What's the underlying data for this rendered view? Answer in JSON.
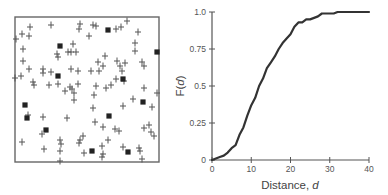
{
  "chart_data": [
    {
      "type": "scatter",
      "title": "",
      "description": "Spatial point pattern in a square plot: crosses and filled squares",
      "xlabel": "",
      "ylabel": "",
      "frame": {
        "left": 15,
        "top": 17,
        "right": 159,
        "bottom": 162
      },
      "series": [
        {
          "name": "cross",
          "marker": "+",
          "points": [
            [
              30,
              27
            ],
            [
              51,
              25
            ],
            [
              80,
              24
            ],
            [
              79,
              29
            ],
            [
              93,
              25
            ],
            [
              96,
              26
            ],
            [
              116,
              29
            ],
            [
              121,
              27
            ],
            [
              127,
              21
            ],
            [
              138,
              32
            ],
            [
              22,
              34
            ],
            [
              29,
              36
            ],
            [
              16,
              39
            ],
            [
              89,
              36
            ],
            [
              73,
              44
            ],
            [
              135,
              43
            ],
            [
              23,
              49
            ],
            [
              57,
              54
            ],
            [
              58,
              57
            ],
            [
              68,
              52
            ],
            [
              71,
              52
            ],
            [
              76,
              52
            ],
            [
              135,
              51
            ],
            [
              23,
              61
            ],
            [
              105,
              56
            ],
            [
              98,
              62
            ],
            [
              117,
              61
            ],
            [
              125,
              63
            ],
            [
              142,
              62
            ],
            [
              103,
              66
            ],
            [
              120,
              66
            ],
            [
              144,
              66
            ],
            [
              29,
              69
            ],
            [
              43,
              69
            ],
            [
              43,
              73
            ],
            [
              51,
              72
            ],
            [
              71,
              69
            ],
            [
              78,
              71
            ],
            [
              91,
              71
            ],
            [
              99,
              71
            ],
            [
              122,
              71
            ],
            [
              21,
              76
            ],
            [
              15,
              78
            ],
            [
              33,
              82
            ],
            [
              34,
              85
            ],
            [
              49,
              85
            ],
            [
              58,
              84
            ],
            [
              70,
              87
            ],
            [
              72,
              89
            ],
            [
              78,
              84
            ],
            [
              65,
              91
            ],
            [
              74,
              93
            ],
            [
              96,
              86
            ],
            [
              106,
              88
            ],
            [
              111,
              85
            ],
            [
              116,
              79
            ],
            [
              124,
              81
            ],
            [
              144,
              88
            ],
            [
              157,
              93
            ],
            [
              94,
              95
            ],
            [
              74,
              100
            ],
            [
              133,
              99
            ],
            [
              123,
              106
            ],
            [
              152,
              107
            ],
            [
              93,
              108
            ],
            [
              28,
              115
            ],
            [
              43,
              117
            ],
            [
              67,
              118
            ],
            [
              95,
              122
            ],
            [
              103,
              127
            ],
            [
              115,
              129
            ],
            [
              119,
              131
            ],
            [
              144,
              128
            ],
            [
              149,
              125
            ],
            [
              151,
              132
            ],
            [
              154,
              136
            ],
            [
              42,
              134
            ],
            [
              83,
              136
            ],
            [
              80,
              140
            ],
            [
              108,
              140
            ],
            [
              22,
              142
            ],
            [
              60,
              140
            ],
            [
              61,
              144
            ],
            [
              79,
              143
            ],
            [
              44,
              149
            ],
            [
              60,
              151
            ],
            [
              84,
              153
            ],
            [
              102,
              146
            ],
            [
              103,
              154
            ],
            [
              123,
              147
            ],
            [
              139,
              148
            ],
            [
              140,
              151
            ],
            [
              102,
              157
            ],
            [
              142,
              159
            ],
            [
              60,
              161
            ]
          ]
        },
        {
          "name": "square",
          "marker": "filled-square",
          "points": [
            [
              108,
              30
            ],
            [
              60,
              46
            ],
            [
              157,
              52
            ],
            [
              58,
              76
            ],
            [
              123,
              79
            ],
            [
              143,
              102
            ],
            [
              25,
              105
            ],
            [
              27,
              118
            ],
            [
              109,
              116
            ],
            [
              46,
              130
            ],
            [
              92,
              151
            ],
            [
              128,
              152
            ]
          ]
        }
      ]
    },
    {
      "type": "line",
      "title": "",
      "xlabel": "Distance, d",
      "xlabel_prefix": "Distance, ",
      "xlabel_var": "d",
      "ylabel": "F(d)",
      "xlim": [
        0,
        40
      ],
      "ylim": [
        0,
        1.0
      ],
      "grid": false,
      "legend": null,
      "x_ticks": [
        0,
        10,
        20,
        30,
        40
      ],
      "x_tick_labels": [
        "0",
        "10",
        "20",
        "30",
        "40"
      ],
      "y_ticks": [
        0,
        0.25,
        0.5,
        0.75,
        1.0
      ],
      "y_tick_labels": [
        "0",
        "0.25",
        "0.5",
        "0.75",
        "1.0"
      ],
      "series": [
        {
          "name": "F(d)",
          "x": [
            0,
            1,
            2,
            3,
            4,
            5,
            6,
            7,
            8,
            9,
            10,
            11,
            12,
            13,
            14,
            15,
            16,
            17,
            18,
            19,
            20,
            21,
            22,
            23,
            24,
            25,
            26,
            27,
            28,
            29,
            30,
            31,
            32,
            34,
            36,
            38,
            40
          ],
          "y": [
            0,
            0.01,
            0.02,
            0.03,
            0.05,
            0.08,
            0.1,
            0.17,
            0.22,
            0.3,
            0.37,
            0.42,
            0.5,
            0.55,
            0.62,
            0.66,
            0.7,
            0.75,
            0.79,
            0.82,
            0.85,
            0.9,
            0.93,
            0.93,
            0.95,
            0.95,
            0.96,
            0.97,
            0.99,
            0.99,
            0.99,
            0.99,
            1.0,
            1.0,
            1.0,
            1.0,
            1.0
          ]
        }
      ]
    }
  ]
}
